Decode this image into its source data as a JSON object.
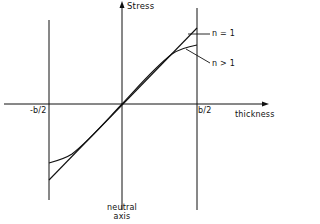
{
  "diagram": {
    "type": "stress-distribution",
    "axes": {
      "y_label": "Stress",
      "x_label": "thickness"
    },
    "ticks": {
      "left": "-b/2",
      "right": "b/2"
    },
    "annotations": {
      "n_equals_1": "n = 1",
      "n_greater_1": "n > 1",
      "neutral_axis_line1": "neutral",
      "neutral_axis_line2": "axis"
    },
    "colors": {
      "line": "#111111",
      "background": "#ffffff"
    }
  }
}
